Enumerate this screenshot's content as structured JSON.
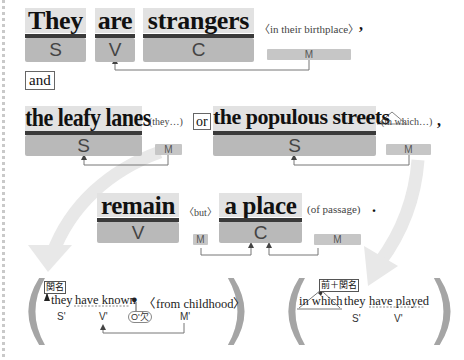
{
  "sentence1": {
    "words": [
      {
        "text": "They",
        "role": "S"
      },
      {
        "text": "are",
        "role": "V"
      },
      {
        "text": "strangers",
        "role": "C"
      }
    ],
    "modifier": {
      "text": "〈in their birthplace〉",
      "role": "M"
    },
    "punct": ","
  },
  "conjunction": "and",
  "sentence2": {
    "subject1": {
      "text": "the leafy lanes",
      "role": "S",
      "modifier": "(they…)",
      "modifier_role": "M"
    },
    "or_label": "or",
    "subject2": {
      "text": "the populous streets",
      "role": "S",
      "modifier": "(in which…)",
      "modifier_role": "M"
    },
    "punct": ","
  },
  "sentence3": {
    "verb": {
      "text": "remain",
      "role": "V"
    },
    "but": {
      "text": "〈but〉",
      "role": "M"
    },
    "complement": {
      "text": "a place",
      "role": "C"
    },
    "of": {
      "text": "(of passage)",
      "role": "M"
    },
    "punct": "."
  },
  "clause_left": {
    "tag": "関名",
    "words": [
      "they",
      "have known",
      "●",
      "〈from childhood〉"
    ],
    "roles": [
      "S'",
      "V'",
      "O'欠",
      "M'"
    ]
  },
  "clause_right": {
    "tag": "前＋関名",
    "words": [
      "in which",
      "they",
      "have played"
    ],
    "roles": [
      "S'",
      "V'"
    ]
  },
  "colors": {
    "word_bg": "#e2e2e2",
    "role_bg": "#b9b9b9",
    "bar": "#3a3a3a",
    "arrow_line": "#777777",
    "big_arrow": "#e6e6e6",
    "paren": "#a5a5a5"
  }
}
